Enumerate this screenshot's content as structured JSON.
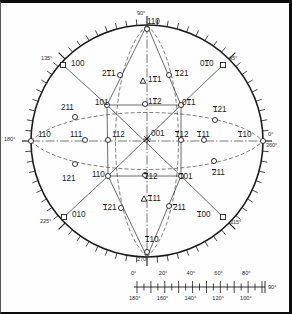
{
  "figure": {
    "type": "stereographic-projection"
  },
  "circumference_angles": [
    {
      "label": "90°",
      "deg": 90
    },
    {
      "label": "135°",
      "deg": 135
    },
    {
      "label": "180°",
      "deg": 180
    },
    {
      "label": "225°",
      "deg": 225
    },
    {
      "label": "270°",
      "deg": 270
    },
    {
      "label": "315°",
      "deg": 315
    },
    {
      "label": "0°",
      "deg": 0
    },
    {
      "label": "360°",
      "deg": 360
    },
    {
      "label": "45°",
      "deg": 45
    }
  ],
  "poles": [
    {
      "id": "p-001",
      "text": "001",
      "bars": [
        0,
        0,
        0
      ],
      "marker": "cross",
      "x": 146,
      "y": 136,
      "lx": 150,
      "ly": 127
    },
    {
      "id": "p-100",
      "text": "100",
      "bars": [
        0,
        0,
        0
      ],
      "marker": "square",
      "x": 62,
      "y": 62,
      "lx": 70,
      "ly": 57
    },
    {
      "id": "p-010b",
      "text": "010",
      "bars": [
        0,
        1,
        0
      ],
      "marker": "square",
      "x": 222,
      "y": 62,
      "lx": 199,
      "ly": 57
    },
    {
      "id": "p-010",
      "text": "010",
      "bars": [
        0,
        0,
        0
      ],
      "marker": "square",
      "x": 63,
      "y": 214,
      "lx": 71,
      "ly": 208
    },
    {
      "id": "p-100b",
      "text": "100",
      "bars": [
        1,
        0,
        0
      ],
      "marker": "square",
      "x": 222,
      "y": 214,
      "lx": 196,
      "ly": 208
    },
    {
      "id": "p-110r",
      "text": "110",
      "bars": [
        0,
        0,
        0
      ],
      "marker": "circle",
      "x": 30,
      "y": 138,
      "lx": 37,
      "ly": 128
    },
    {
      "id": "p-110rb",
      "text": "110",
      "bars": [
        1,
        0,
        0
      ],
      "marker": "circle",
      "x": 262,
      "y": 138,
      "lx": 237,
      "ly": 128
    },
    {
      "id": "p-110t",
      "text": "110",
      "bars": [
        0,
        0,
        0
      ],
      "marker": "circle",
      "x": 146,
      "y": 26,
      "lx": 146,
      "ly": 15
    },
    {
      "id": "p-110bt",
      "text": "110",
      "bars": [
        1,
        0,
        0
      ],
      "marker": "circle",
      "x": 146,
      "y": 249,
      "lx": 144,
      "ly": 233
    },
    {
      "id": "p-111l",
      "text": "111",
      "bars": [
        0,
        0,
        0
      ],
      "marker": "circle",
      "x": 84,
      "y": 137,
      "lx": 69,
      "ly": 128
    },
    {
      "id": "p-111r",
      "text": "111",
      "bars": [
        1,
        0,
        0
      ],
      "marker": "circle",
      "x": 203,
      "y": 137,
      "lx": 196,
      "ly": 128
    },
    {
      "id": "p-111t",
      "text": "111",
      "bars": [
        0,
        1,
        0
      ],
      "marker": "tri",
      "x": 142,
      "y": 78,
      "lx": 147,
      "ly": 73
    },
    {
      "id": "p-111bt",
      "text": "111",
      "bars": [
        1,
        0,
        0
      ],
      "marker": "tri",
      "x": 143,
      "y": 196,
      "lx": 147,
      "ly": 192
    },
    {
      "id": "p-112l",
      "text": "112",
      "bars": [
        0,
        0,
        0
      ],
      "marker": "circle",
      "x": 107,
      "y": 137,
      "lx": 111,
      "ly": 128
    },
    {
      "id": "p-112r",
      "text": "112",
      "bars": [
        1,
        0,
        0
      ],
      "marker": "circle",
      "x": 180,
      "y": 137,
      "lx": 174,
      "ly": 128
    },
    {
      "id": "p-112t",
      "text": "112",
      "bars": [
        0,
        1,
        0
      ],
      "marker": "circle",
      "x": 144,
      "y": 101,
      "lx": 147,
      "ly": 95
    },
    {
      "id": "p-112bt",
      "text": "112",
      "bars": [
        1,
        0,
        0
      ],
      "marker": "circle",
      "x": 144,
      "y": 172,
      "lx": 143,
      "ly": 170
    },
    {
      "id": "p-101tl",
      "text": "101",
      "bars": [
        0,
        0,
        0
      ],
      "marker": "circle",
      "x": 106,
      "y": 102,
      "lx": 94,
      "ly": 96
    },
    {
      "id": "p-011tr",
      "text": "011",
      "bars": [
        0,
        1,
        0
      ],
      "marker": "circle",
      "x": 180,
      "y": 102,
      "lx": 181,
      "ly": 96
    },
    {
      "id": "p-110bl",
      "text": "110",
      "bars": [
        0,
        0,
        0
      ],
      "marker": "circle",
      "x": 107,
      "y": 173,
      "lx": 91,
      "ly": 168
    },
    {
      "id": "p-101br",
      "text": "101",
      "bars": [
        1,
        0,
        0
      ],
      "marker": "circle",
      "x": 180,
      "y": 173,
      "lx": 178,
      "ly": 170
    },
    {
      "id": "p-211l",
      "text": "211",
      "bars": [
        0,
        0,
        0
      ],
      "marker": "circle",
      "x": 74,
      "y": 114,
      "lx": 60,
      "ly": 101
    },
    {
      "id": "p-121r",
      "text": "121",
      "bars": [
        1,
        0,
        0
      ],
      "marker": "circle",
      "x": 214,
      "y": 117,
      "lx": 212,
      "ly": 103
    },
    {
      "id": "p-121bl",
      "text": "121",
      "bars": [
        0,
        0,
        0
      ],
      "marker": "circle",
      "x": 74,
      "y": 161,
      "lx": 61,
      "ly": 172
    },
    {
      "id": "p-211br",
      "text": "211",
      "bars": [
        1,
        0,
        0
      ],
      "marker": "circle",
      "x": 213,
      "y": 158,
      "lx": 211,
      "ly": 166
    },
    {
      "id": "p-211t",
      "text": "211",
      "bars": [
        0,
        1,
        0
      ],
      "marker": "circle",
      "x": 119,
      "y": 72,
      "lx": 101,
      "ly": 67
    },
    {
      "id": "p-121t",
      "text": "121",
      "bars": [
        1,
        0,
        0
      ],
      "marker": "circle",
      "x": 168,
      "y": 72,
      "lx": 174,
      "ly": 67
    },
    {
      "id": "p-121bb",
      "text": "121",
      "bars": [
        1,
        0,
        0
      ],
      "marker": "circle",
      "x": 120,
      "y": 205,
      "lx": 102,
      "ly": 201
    },
    {
      "id": "p-211bb",
      "text": "211",
      "bars": [
        1,
        0,
        0
      ],
      "marker": "circle",
      "x": 168,
      "y": 203,
      "lx": 172,
      "ly": 201
    }
  ],
  "scale": {
    "top_labels": [
      "0°",
      "20°",
      "40°",
      "60°",
      "80°"
    ],
    "bottom_labels": [
      "180°",
      "160°",
      "140°",
      "120°",
      "100°"
    ],
    "end_label": "90°"
  }
}
